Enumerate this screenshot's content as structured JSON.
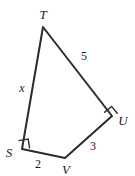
{
  "figure": {
    "kind": "quadrilateral-geometry-diagram",
    "background_color": "#ffffff",
    "stroke_color": "#2b2b2b",
    "vertices": [
      {
        "name": "T",
        "label": "T",
        "x": 43,
        "y": 27,
        "label_x": 43,
        "label_y": 14,
        "right_angle": false
      },
      {
        "name": "U",
        "label": "U",
        "x": 112,
        "y": 116,
        "label_x": 123,
        "label_y": 120,
        "right_angle": true
      },
      {
        "name": "V",
        "label": "V",
        "x": 65,
        "y": 158,
        "label_x": 66,
        "label_y": 169,
        "right_angle": false
      },
      {
        "name": "S",
        "label": "S",
        "x": 22,
        "y": 149,
        "label_x": 9,
        "label_y": 152,
        "right_angle": true
      }
    ],
    "sides": [
      {
        "name": "TU",
        "label": "5",
        "from": "T",
        "to": "U",
        "label_x": 84,
        "label_y": 56,
        "is_variable": false
      },
      {
        "name": "UV",
        "label": "3",
        "from": "U",
        "to": "V",
        "label_x": 93,
        "label_y": 146,
        "is_variable": false
      },
      {
        "name": "VS",
        "label": "2",
        "from": "V",
        "to": "S",
        "label_x": 38,
        "label_y": 164,
        "is_variable": false
      },
      {
        "name": "ST",
        "label": "x",
        "from": "S",
        "to": "T",
        "label_x": 22,
        "label_y": 88,
        "is_variable": true
      }
    ],
    "outline_path": "M 43 27 L 112 116 L 65 158 L 22 149 Z",
    "right_angle_marks": [
      {
        "at": "S",
        "path": "M 18.4 140.6 L 28.2 139.0 L 29.6 148.3"
      },
      {
        "at": "U",
        "path": "M 104.2 112.6 L 111.6 106.4 L 117.6 113.8"
      }
    ]
  }
}
